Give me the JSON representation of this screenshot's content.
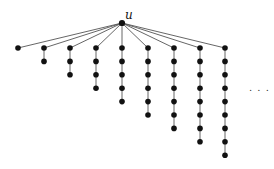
{
  "diagram": {
    "type": "tree",
    "root": {
      "label": "u",
      "x": 122,
      "y": 23
    },
    "label_offset": {
      "dx": 3,
      "dy": -4
    },
    "columns_x": [
      18,
      44,
      70,
      96,
      122,
      148,
      174,
      200,
      225
    ],
    "path_lengths": [
      1,
      2,
      3,
      4,
      5,
      6,
      7,
      8,
      9
    ],
    "top_y": 48,
    "spacing": 13.4,
    "node_radius": 2.8,
    "ellipsis": {
      "text": ". . .",
      "x": 249,
      "y": 91
    },
    "colors": {
      "node": "#111111",
      "edge": "#555555"
    }
  }
}
